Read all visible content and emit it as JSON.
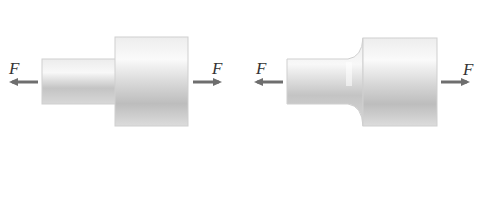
{
  "figures": [
    {
      "id": "sharp-shoulder",
      "description": "Stepped shaft with sharp shoulder under axial tension",
      "left_force_label": "F",
      "right_force_label": "F"
    },
    {
      "id": "filleted-shoulder",
      "description": "Stepped shaft with filleted shoulder under axial tension",
      "left_force_label": "F",
      "right_force_label": "F"
    }
  ],
  "colors": {
    "arrow": "#6e6e6e",
    "body_light": "#f4f4f4",
    "body_dark": "#b8b8b8",
    "outline": "#c8c8c8"
  }
}
